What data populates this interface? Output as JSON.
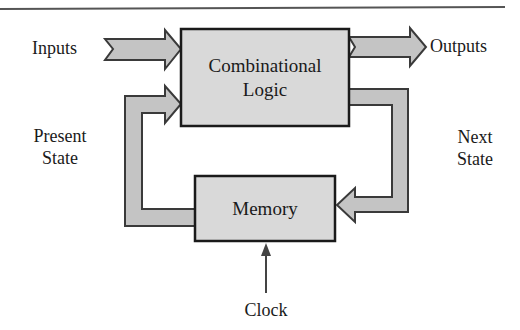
{
  "diagram": {
    "blocks": {
      "combinational": {
        "line1": "Combinational",
        "line2": "Logic"
      },
      "memory": {
        "label": "Memory"
      }
    },
    "labels": {
      "inputs": "Inputs",
      "outputs": "Outputs",
      "present_state_1": "Present",
      "present_state_2": "State",
      "next_state_1": "Next",
      "next_state_2": "State",
      "clock": "Clock"
    },
    "colors": {
      "box_fill": "#d9d9d9",
      "arrow_fill": "#c4c4c4",
      "stroke": "#2a2a2a",
      "rule": "#555555"
    }
  }
}
